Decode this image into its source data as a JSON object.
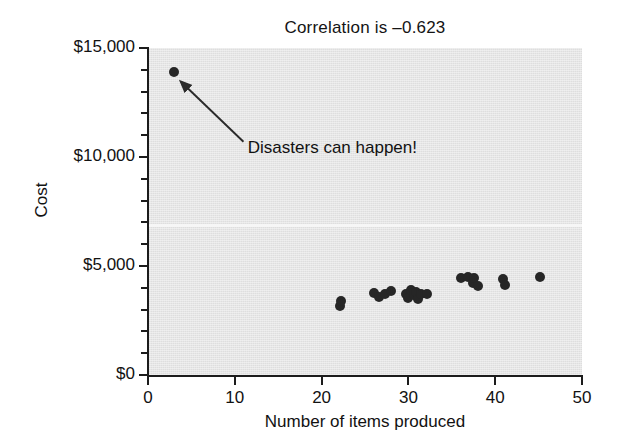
{
  "chart_data": {
    "type": "scatter",
    "title": "Correlation is –0.623",
    "xlabel": "Number of items produced",
    "ylabel": "Cost",
    "xlim": [
      0,
      50
    ],
    "ylim": [
      0,
      15000
    ],
    "xticks": [
      0,
      10,
      20,
      30,
      40,
      50
    ],
    "xtick_labels": [
      "0",
      "10",
      "20",
      "30",
      "40",
      "50"
    ],
    "yticks": [
      0,
      5000,
      10000,
      15000
    ],
    "ytick_labels": [
      "$0",
      "$5,000",
      "$10,000",
      "$15,000"
    ],
    "yticks_minor": [
      1000,
      2000,
      3000,
      4000,
      6000,
      7000,
      8000,
      9000,
      11000,
      12000,
      13000,
      14000
    ],
    "grid": false,
    "legend": null,
    "point_color": "#262626",
    "plot_background": "#e4e4e4",
    "page_background": "#ffffff",
    "annotations": [
      {
        "text": "Disasters can happen!",
        "x": 11.5,
        "y": 10350,
        "arrow_from_x": 11.0,
        "arrow_from_y": 10700,
        "arrow_to_x": 3.8,
        "arrow_to_y": 13450
      }
    ],
    "points": [
      {
        "x": 3.0,
        "y": 13900
      },
      {
        "x": 22.1,
        "y": 3150
      },
      {
        "x": 22.2,
        "y": 3400
      },
      {
        "x": 26.0,
        "y": 3750
      },
      {
        "x": 26.6,
        "y": 3600
      },
      {
        "x": 27.3,
        "y": 3720
      },
      {
        "x": 28.0,
        "y": 3850
      },
      {
        "x": 29.7,
        "y": 3700
      },
      {
        "x": 30.0,
        "y": 3550
      },
      {
        "x": 30.3,
        "y": 3900
      },
      {
        "x": 30.6,
        "y": 3650
      },
      {
        "x": 30.9,
        "y": 3800
      },
      {
        "x": 31.1,
        "y": 3500
      },
      {
        "x": 31.4,
        "y": 3720
      },
      {
        "x": 32.2,
        "y": 3700
      },
      {
        "x": 36.1,
        "y": 4450
      },
      {
        "x": 36.9,
        "y": 4500
      },
      {
        "x": 37.4,
        "y": 4200
      },
      {
        "x": 37.6,
        "y": 4450
      },
      {
        "x": 38.0,
        "y": 4080
      },
      {
        "x": 40.9,
        "y": 4400
      },
      {
        "x": 41.1,
        "y": 4150
      },
      {
        "x": 45.2,
        "y": 4500
      }
    ]
  }
}
